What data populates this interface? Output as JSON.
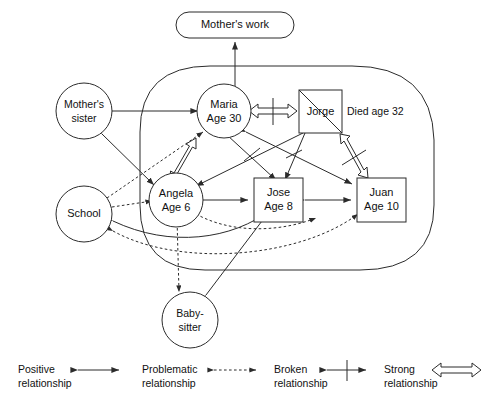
{
  "diagram": {
    "type": "ecomap",
    "line_color": "#2b2b2b",
    "fill_color": "#ffffff",
    "background": "#ffffff"
  },
  "nodes": {
    "mothers_work": {
      "label": "Mother's work",
      "shape": "stadium",
      "inside_household": false
    },
    "mothers_sister": {
      "line1": "Mother's",
      "line2": "sister",
      "shape": "circle",
      "inside_household": false
    },
    "school": {
      "label": "School",
      "shape": "circle",
      "inside_household": false
    },
    "babysitter": {
      "line1": "Baby-",
      "line2": "sitter",
      "shape": "circle",
      "inside_household": false
    },
    "maria": {
      "line1": "Maria",
      "line2": "Age 30",
      "shape": "circle",
      "inside_household": true
    },
    "jorge": {
      "label": "Jorge",
      "shape": "square",
      "deceased": true,
      "note": "Died age 32",
      "inside_household": true
    },
    "angela": {
      "line1": "Angela",
      "line2": "Age 6",
      "shape": "circle",
      "inside_household": true
    },
    "jose": {
      "line1": "Jose",
      "line2": "Age 8",
      "shape": "square",
      "inside_household": true
    },
    "juan": {
      "line1": "Juan",
      "line2": "Age 10",
      "shape": "square",
      "inside_household": true
    }
  },
  "relationships": [
    {
      "from": "maria",
      "to": "mothers_work",
      "type": "positive"
    },
    {
      "from": "mothers_sister",
      "to": "maria",
      "type": "positive"
    },
    {
      "from": "mothers_sister",
      "to": "angela",
      "type": "positive"
    },
    {
      "from": "maria",
      "to": "jorge",
      "type": "strong",
      "broken": true
    },
    {
      "from": "maria",
      "to": "angela",
      "type": "strong"
    },
    {
      "from": "jorge",
      "to": "juan",
      "type": "strong",
      "broken": true
    },
    {
      "from": "maria",
      "to": "jose",
      "type": "positive",
      "broken": true
    },
    {
      "from": "maria",
      "to": "juan",
      "type": "positive"
    },
    {
      "from": "jorge",
      "to": "angela",
      "type": "positive"
    },
    {
      "from": "jorge",
      "to": "jose",
      "type": "positive",
      "broken": true
    },
    {
      "from": "angela",
      "to": "jose",
      "type": "positive"
    },
    {
      "from": "jose",
      "to": "juan",
      "type": "positive"
    },
    {
      "from": "school",
      "to": "angela",
      "type": "problematic"
    },
    {
      "from": "school",
      "to": "maria",
      "type": "problematic"
    },
    {
      "from": "school",
      "to": "jose",
      "type": "positive"
    },
    {
      "from": "school",
      "to": "juan",
      "type": "problematic"
    },
    {
      "from": "angela",
      "to": "babysitter",
      "type": "problematic"
    },
    {
      "from": "babysitter",
      "to": "jose",
      "type": "positive"
    }
  ],
  "legend": [
    {
      "id": "positive",
      "line1": "Positive",
      "line2": "relationship",
      "symbol": "solid-double-arrow"
    },
    {
      "id": "problematic",
      "line1": "Problematic",
      "line2": "relationship",
      "symbol": "dotted-double-arrow"
    },
    {
      "id": "broken",
      "line1": "Broken",
      "line2": "relationship",
      "symbol": "double-arrow-with-bar"
    },
    {
      "id": "strong",
      "line1": "Strong",
      "line2": "relationship",
      "symbol": "hollow-double-arrow"
    }
  ]
}
